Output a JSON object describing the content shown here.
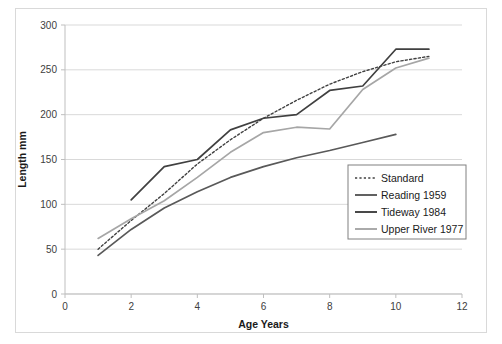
{
  "chart_data": {
    "type": "line",
    "title": "",
    "xlabel": "Age Years",
    "ylabel": "Length mm",
    "xlim": [
      0,
      12
    ],
    "ylim": [
      0,
      300
    ],
    "xticks": [
      0,
      2,
      4,
      6,
      8,
      10,
      12
    ],
    "yticks": [
      0,
      50,
      100,
      150,
      200,
      250,
      300
    ],
    "grid": "horizontal",
    "legend_position": "lower-right",
    "series": [
      {
        "name": "Standard",
        "style": "dotted",
        "color": "#404040",
        "x": [
          1,
          2,
          3,
          4,
          5,
          6,
          7,
          8,
          9,
          10,
          11
        ],
        "y": [
          50,
          82,
          112,
          145,
          172,
          196,
          216,
          234,
          248,
          259,
          265
        ]
      },
      {
        "name": "Reading 1959",
        "style": "solid",
        "color": "#595959",
        "x": [
          1,
          2,
          3,
          4,
          5,
          6,
          7,
          8,
          9,
          10
        ],
        "y": [
          43,
          72,
          96,
          114,
          130,
          142,
          152,
          160,
          169,
          178
        ]
      },
      {
        "name": "Tideway 1984",
        "style": "solid",
        "color": "#404040",
        "x": [
          2,
          3,
          4,
          5,
          6,
          7,
          8,
          9,
          10,
          11
        ],
        "y": [
          105,
          142,
          150,
          183,
          196,
          200,
          227,
          232,
          273,
          273
        ]
      },
      {
        "name": "Upper River 1977",
        "style": "solid",
        "color": "#a6a6a6",
        "x": [
          1,
          2,
          3,
          4,
          5,
          6,
          7,
          8,
          9,
          10,
          11
        ],
        "y": [
          62,
          84,
          104,
          130,
          158,
          180,
          186,
          184,
          228,
          252,
          263
        ]
      }
    ]
  },
  "axes": {
    "x_title": "Age Years",
    "y_title": "Length mm",
    "x_tick_labels": [
      "0",
      "2",
      "4",
      "6",
      "8",
      "10",
      "12"
    ],
    "y_tick_labels": [
      "0",
      "50",
      "100",
      "150",
      "200",
      "250",
      "300"
    ]
  },
  "legend": {
    "items": [
      {
        "label": "Standard"
      },
      {
        "label": "Reading 1959"
      },
      {
        "label": "Tideway 1984"
      },
      {
        "label": "Upper River 1977"
      }
    ]
  },
  "colors": {
    "standard": "#404040",
    "reading": "#595959",
    "tideway": "#404040",
    "upper_river": "#a6a6a6",
    "grid": "#d9d9d9",
    "axis": "#bfbfbf",
    "frame": "#d9d9d9"
  }
}
